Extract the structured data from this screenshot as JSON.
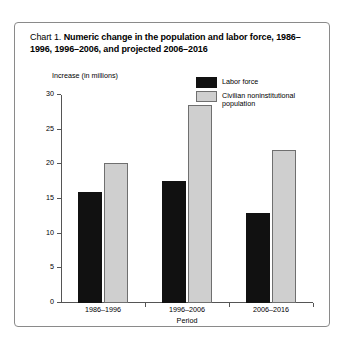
{
  "figure": {
    "caption_prefix": "Chart 1.",
    "caption_body": "Numeric change in the population and labor force, 1986–1996, 1996–2006, and projected 2006–2016",
    "frame_color": "#8a8a8a",
    "background": "#ffffff"
  },
  "chart_data": {
    "type": "bar",
    "title": "Chart 1. Numeric change in the population and labor force, 1986–1996, 1996–2006, and projected 2006–2016",
    "xlabel": "Period",
    "ylabel": "Increase (in millions)",
    "categories": [
      "1986–1996",
      "1996–2006",
      "2006–2016"
    ],
    "series": [
      {
        "name": "Labor force",
        "color": "#111111",
        "values": [
          16.0,
          17.6,
          13.0
        ]
      },
      {
        "name": "Civilian noninstitutional population",
        "color": "#cfcfcf",
        "values": [
          20.2,
          28.5,
          22.0
        ]
      }
    ],
    "ylim": [
      0,
      30
    ],
    "yticks": [
      0,
      5,
      10,
      15,
      20,
      25,
      30
    ],
    "ytick_labels": [
      "0",
      "5",
      "10",
      "15",
      "20",
      "25",
      "30"
    ],
    "grid": false,
    "legend_position": "top-right"
  },
  "legend": {
    "items": [
      {
        "label": "Labor force",
        "color": "#111111"
      },
      {
        "label": "Civilian noninstitutional population",
        "color": "#cfcfcf"
      }
    ]
  }
}
